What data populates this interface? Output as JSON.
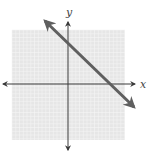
{
  "chart_data": {
    "type": "line",
    "title": "",
    "xlabel": "x",
    "ylabel": "y",
    "grid": true,
    "xlim": [
      -7.5,
      7.5
    ],
    "ylim": [
      -7.5,
      7.5
    ],
    "series": [
      {
        "name": "line",
        "x": [
          -3.2,
          8.9
        ],
        "y": [
          8.5,
          -3.2
        ],
        "equation_estimate": "y = -x + 5.5",
        "y_intercept_estimate": 5.5,
        "x_intercept_estimate": 5.7,
        "slope_estimate": -1,
        "arrows": "both"
      }
    ],
    "legend": null
  },
  "axes": {
    "x_label": "x",
    "y_label": "y"
  },
  "colors": {
    "grid_background": "#e6e6e6",
    "grid_lines": "#f5f5f5",
    "axis": "#3a3a3a",
    "line": "#5f5f5f"
  }
}
